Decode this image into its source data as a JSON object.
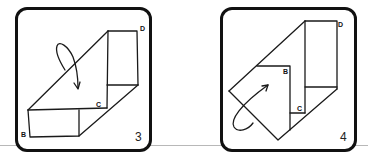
{
  "panels": [
    {
      "step_number": "3",
      "labels": {
        "b": "B",
        "c": "C",
        "d": "D"
      },
      "arrow": "rotation-arrow"
    },
    {
      "step_number": "4",
      "labels": {
        "b": "B",
        "c": "C",
        "d": "D"
      },
      "arrow": "rotation-arrow"
    }
  ],
  "colors": {
    "stroke": "#1a1a1a",
    "frame": "#111111",
    "baseline": "#b8b8b8"
  }
}
